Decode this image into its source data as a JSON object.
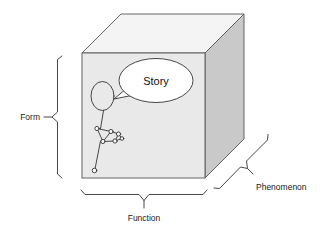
{
  "diagram": {
    "type": "3d-cube-framework",
    "background_color": "#ffffff",
    "cube": {
      "name": "design-space-cube",
      "faces": {
        "front": {
          "label": "front-face",
          "fill": "#e9e9e9",
          "stroke": "#555555"
        },
        "top": {
          "label": "top-face",
          "fill": "#f4f4f4",
          "stroke": "#555555"
        },
        "right": {
          "label": "right-face",
          "fill": "#c9c9c9",
          "stroke": "#555555"
        }
      }
    },
    "axes": [
      {
        "id": "form",
        "label": "Form",
        "orientation": "vertical",
        "side": "left"
      },
      {
        "id": "function",
        "label": "Function",
        "orientation": "horizontal",
        "side": "bottom"
      },
      {
        "id": "phenomenon",
        "label": "Phenomenon",
        "orientation": "diagonal",
        "side": "bottom-right"
      }
    ],
    "scene": {
      "speech_bubble": {
        "name": "story-speech-bubble",
        "text": "Story",
        "fill": "#ffffff",
        "stroke": "#333333"
      },
      "figure": {
        "name": "stick-figure",
        "description": "person with oval head and jointed node limbs",
        "stroke": "#333333"
      }
    },
    "colors": {
      "line": "#333333",
      "text": "#1a1a1a",
      "front_face": "#e9e9e9",
      "top_face": "#f4f4f4",
      "right_face": "#c9c9c9"
    }
  }
}
